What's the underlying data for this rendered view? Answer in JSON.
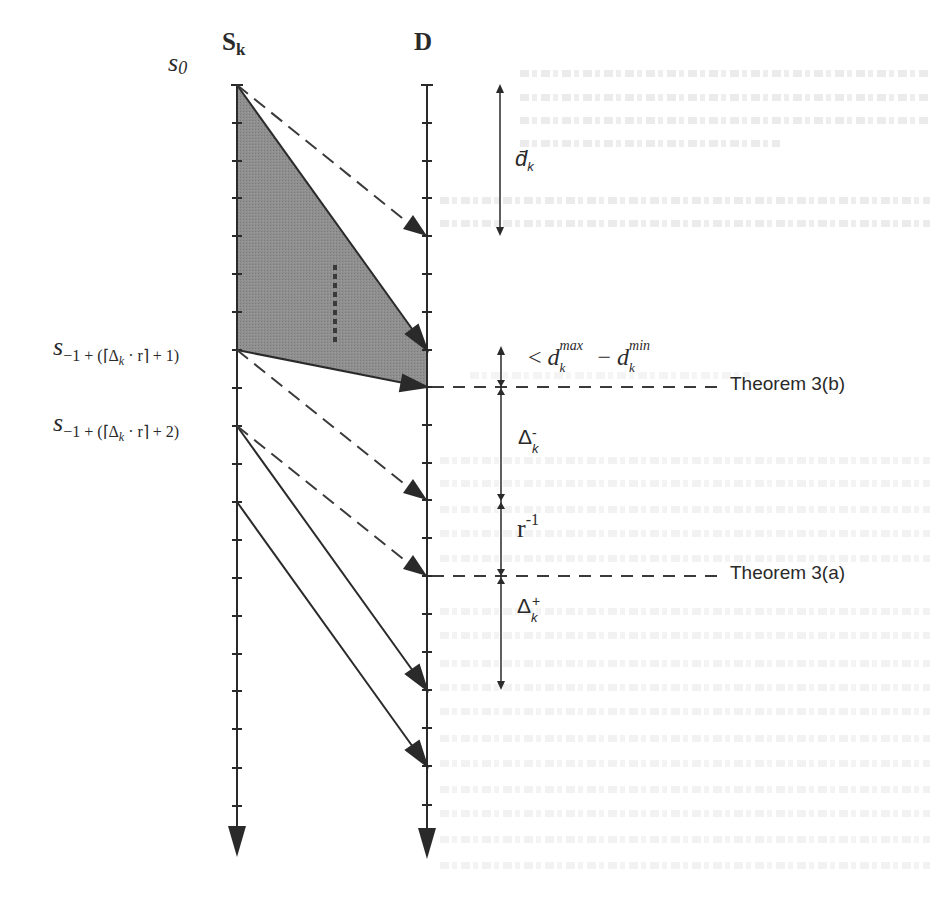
{
  "figure": {
    "axes": {
      "sender": {
        "label": "S",
        "label_sub": "k"
      },
      "receiver": {
        "label": "D"
      }
    },
    "start_label": {
      "base": "s",
      "sub": "0"
    },
    "sender_labels": [
      {
        "base": "s",
        "sub": "−1 + (⌈Δ",
        "sub2": "k",
        "sub3": " · r⌉ + 1)"
      },
      {
        "base": "s",
        "sub": "−1 + (⌈Δ",
        "sub2": "k",
        "sub3": " · r⌉ + 2)"
      }
    ],
    "dimensions": {
      "d_bar": {
        "base": "d̄",
        "sub": "k"
      },
      "dmax_dmin": {
        "prefix": "< ",
        "d1": "d",
        "d1_sup": "max",
        "d1_sub": "k",
        "minus": " − ",
        "d2": "d",
        "d2_sup": "min",
        "d2_sub": "k"
      },
      "delta_minus": {
        "base": "Δ",
        "sup": "-",
        "sub": "k"
      },
      "r_inv": {
        "base": "r",
        "sup": "-1"
      },
      "delta_plus": {
        "base": "Δ",
        "sup": "+",
        "sub": "k"
      }
    },
    "theorem_markers": [
      {
        "label": "Theorem 3(b)"
      },
      {
        "label": "Theorem 3(a)"
      }
    ],
    "colors": {
      "ink": "#2a2a2a",
      "shaded_region": "#8c8c8c",
      "dashed": "#3a3a3a"
    }
  }
}
